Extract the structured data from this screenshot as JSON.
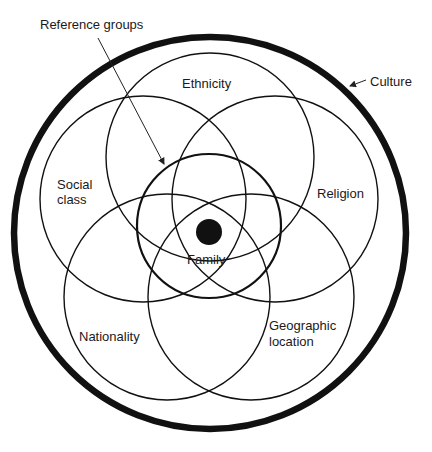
{
  "diagram": {
    "type": "nested-overlapping-circles",
    "labels": {
      "culture": "Culture",
      "reference_groups": "Reference groups",
      "ethnicity": "Ethnicity",
      "social_class_line1": "Social",
      "social_class_line2": "class",
      "religion": "Religion",
      "nationality": "Nationality",
      "geographic_line1": "Geographic",
      "geographic_line2": "location",
      "family": "Family"
    },
    "nodes": [
      {
        "id": "culture",
        "label": "Culture",
        "role": "outer boundary"
      },
      {
        "id": "ethnicity",
        "label": "Ethnicity",
        "role": "overlapping circle"
      },
      {
        "id": "social-class",
        "label": "Social class",
        "role": "overlapping circle"
      },
      {
        "id": "religion",
        "label": "Religion",
        "role": "overlapping circle"
      },
      {
        "id": "nationality",
        "label": "Nationality",
        "role": "overlapping circle"
      },
      {
        "id": "geographic-location",
        "label": "Geographic location",
        "role": "overlapping circle"
      },
      {
        "id": "reference-groups",
        "label": "Reference groups",
        "role": "inner circle"
      },
      {
        "id": "family",
        "label": "Family",
        "role": "center dot"
      }
    ],
    "colors": {
      "stroke": "#111111",
      "background": "#ffffff",
      "text": "#1a1a1a"
    }
  }
}
